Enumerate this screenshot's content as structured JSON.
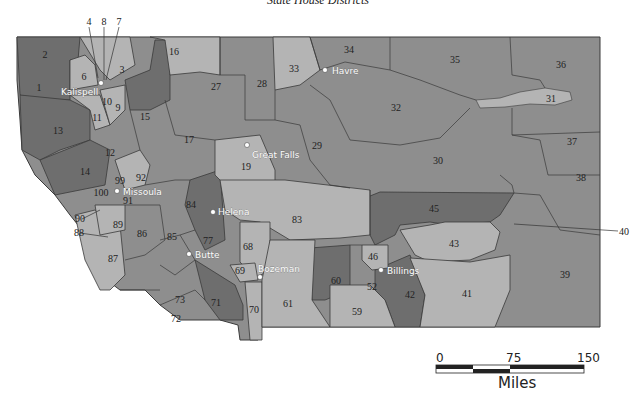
{
  "title": "State House Districts",
  "colors": {
    "dark": "#6e6e6e",
    "mid": "#8e8e8e",
    "light": "#b4b4b4",
    "border": "#3a3a3a"
  },
  "districts": [
    {
      "id": "1",
      "label": "1"
    },
    {
      "id": "2",
      "label": "2"
    },
    {
      "id": "3",
      "label": "3"
    },
    {
      "id": "4",
      "label": "4"
    },
    {
      "id": "6",
      "label": "6"
    },
    {
      "id": "7",
      "label": "7"
    },
    {
      "id": "8",
      "label": "8"
    },
    {
      "id": "9",
      "label": "9"
    },
    {
      "id": "10",
      "label": "10"
    },
    {
      "id": "11",
      "label": "11"
    },
    {
      "id": "12",
      "label": "12"
    },
    {
      "id": "13",
      "label": "13"
    },
    {
      "id": "14",
      "label": "14"
    },
    {
      "id": "15",
      "label": "15"
    },
    {
      "id": "16",
      "label": "16"
    },
    {
      "id": "17",
      "label": "17"
    },
    {
      "id": "19",
      "label": "19"
    },
    {
      "id": "27",
      "label": "27"
    },
    {
      "id": "28",
      "label": "28"
    },
    {
      "id": "29",
      "label": "29"
    },
    {
      "id": "30",
      "label": "30"
    },
    {
      "id": "31",
      "label": "31"
    },
    {
      "id": "32",
      "label": "32"
    },
    {
      "id": "33",
      "label": "33"
    },
    {
      "id": "34",
      "label": "34"
    },
    {
      "id": "35",
      "label": "35"
    },
    {
      "id": "36",
      "label": "36"
    },
    {
      "id": "37",
      "label": "37"
    },
    {
      "id": "38",
      "label": "38"
    },
    {
      "id": "39",
      "label": "39"
    },
    {
      "id": "40",
      "label": "40"
    },
    {
      "id": "41",
      "label": "41"
    },
    {
      "id": "42",
      "label": "42"
    },
    {
      "id": "43",
      "label": "43"
    },
    {
      "id": "45",
      "label": "45"
    },
    {
      "id": "46",
      "label": "46"
    },
    {
      "id": "52",
      "label": "52"
    },
    {
      "id": "59",
      "label": "59"
    },
    {
      "id": "60",
      "label": "60"
    },
    {
      "id": "61",
      "label": "61"
    },
    {
      "id": "68",
      "label": "68"
    },
    {
      "id": "69",
      "label": "69"
    },
    {
      "id": "70",
      "label": "70"
    },
    {
      "id": "71",
      "label": "71"
    },
    {
      "id": "72",
      "label": "72"
    },
    {
      "id": "73",
      "label": "73"
    },
    {
      "id": "77",
      "label": "77"
    },
    {
      "id": "83",
      "label": "83"
    },
    {
      "id": "84",
      "label": "84"
    },
    {
      "id": "85",
      "label": "85"
    },
    {
      "id": "86",
      "label": "86"
    },
    {
      "id": "87",
      "label": "87"
    },
    {
      "id": "88",
      "label": "88"
    },
    {
      "id": "89",
      "label": "89"
    },
    {
      "id": "90",
      "label": "90"
    },
    {
      "id": "91",
      "label": "91"
    },
    {
      "id": "92",
      "label": "92"
    },
    {
      "id": "99",
      "label": "99"
    },
    {
      "id": "100",
      "label": "100"
    }
  ],
  "cities": [
    {
      "name": "Kalispell"
    },
    {
      "name": "Havre"
    },
    {
      "name": "Great Falls"
    },
    {
      "name": "Missoula"
    },
    {
      "name": "Helena"
    },
    {
      "name": "Butte"
    },
    {
      "name": "Bozeman"
    },
    {
      "name": "Billings"
    }
  ],
  "scale": {
    "ticks": [
      "0",
      "75",
      "150"
    ],
    "unit": "Miles"
  }
}
